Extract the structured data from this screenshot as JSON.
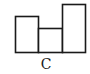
{
  "figure": {
    "label": "C",
    "stroke_color": "#1a1a1a",
    "fill_color": "#ffffff",
    "boxes": [
      {
        "name": "left-box",
        "x": 15.5,
        "y": 16.5,
        "width": 23,
        "height": 36
      },
      {
        "name": "middle-box",
        "x": 38.5,
        "y": 28.5,
        "width": 24,
        "height": 24
      },
      {
        "name": "right-box",
        "x": 62.5,
        "y": 4.5,
        "width": 23,
        "height": 48
      }
    ]
  }
}
